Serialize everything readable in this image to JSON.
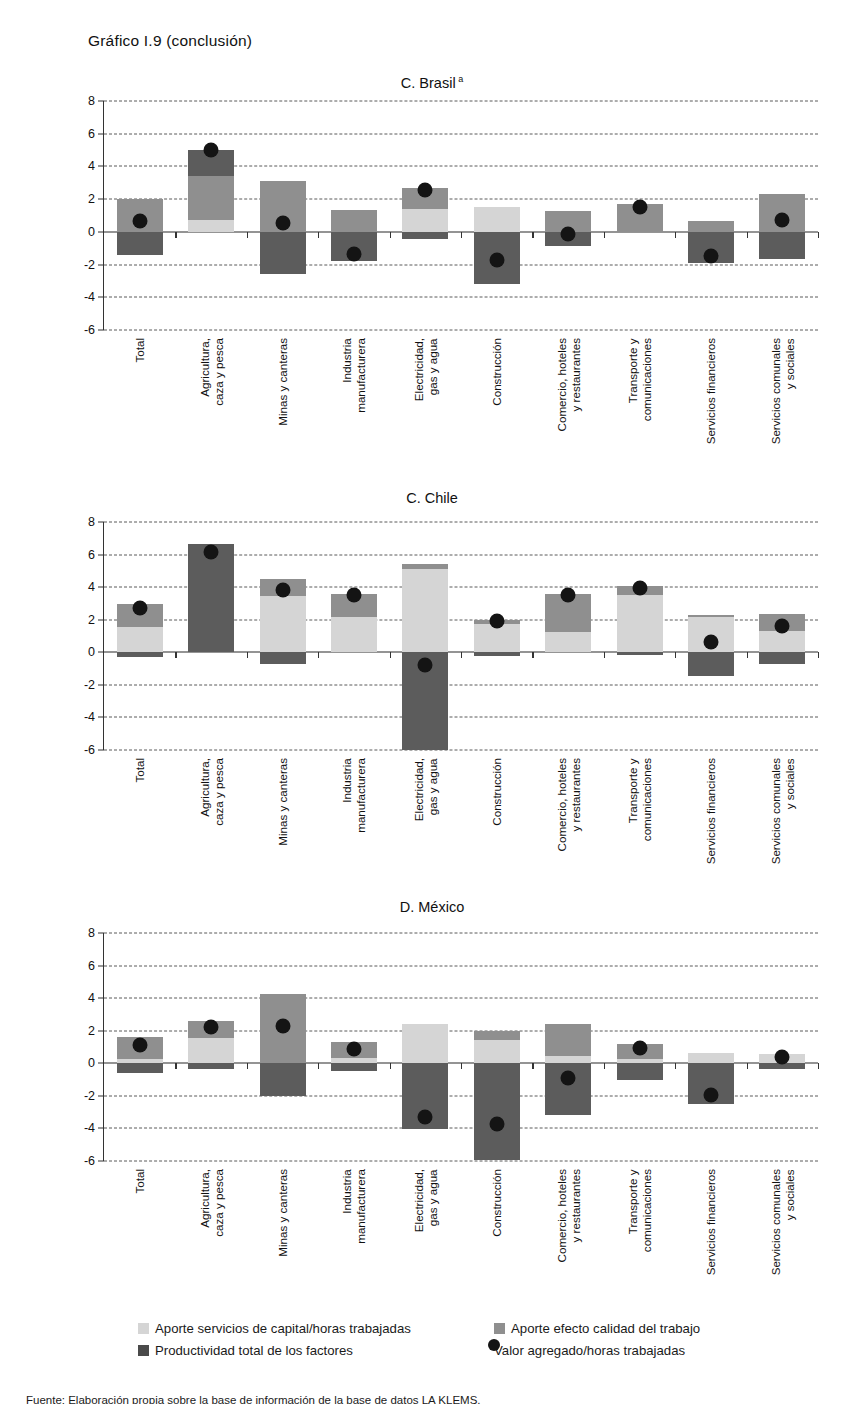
{
  "figure": {
    "title": "Gráfico I.9 (conclusión)",
    "footnote": "Fuente: Elaboración propia sobre la base de información de la base de datos LA KLEMS."
  },
  "axis": {
    "ticks": [
      8,
      6,
      4,
      2,
      0,
      -2,
      -4,
      -6
    ],
    "ymin": -6,
    "ymax": 8
  },
  "categories": [
    "Total",
    "Agricultura,\ncaza y pesca",
    "Minas y canteras",
    "Industria\nmanufacturera",
    "Electricidad,\ngas y agua",
    "Construcción",
    "Comercio, hoteles\ny restaurantes",
    "Transporte y\ncomunicaciones",
    "Servicios financieros",
    "Servicios comunales\ny sociales"
  ],
  "legend": {
    "items": [
      {
        "key": "capital",
        "label": "Aporte servicios de capital/horas trabajadas",
        "color": "#d5d5d5",
        "shape": "square"
      },
      {
        "key": "quality",
        "label": "Aporte efecto calidad del trabajo",
        "color": "#8f8f8f",
        "shape": "square"
      },
      {
        "key": "tfp",
        "label": "Productividad total de los factores",
        "color": "#4a4a4a",
        "shape": "square"
      },
      {
        "key": "value_added",
        "label": "Valor agregado/horas trabajadas",
        "color": "#141414",
        "shape": "circle"
      }
    ]
  },
  "chart_data": [
    {
      "type": "bar",
      "panel_id": "brasil",
      "title": "C. Brasil",
      "title_superscript": "a",
      "stacked": true,
      "grid": true,
      "ylim": [
        -6,
        8
      ],
      "ylabel": "",
      "xlabel": "",
      "categories": [
        "Total",
        "Agricultura, caza y pesca",
        "Minas y canteras",
        "Industria manufacturera",
        "Electricidad, gas y agua",
        "Construcción",
        "Comercio, hoteles y restaurantes",
        "Transporte y comunicaciones",
        "Servicios financieros",
        "Servicios comunales y sociales"
      ],
      "series": [
        {
          "name": "Aporte servicios de capital/horas trabajadas",
          "key": "capital",
          "values": [
            0.0,
            0.7,
            0.0,
            0.0,
            1.4,
            1.5,
            0.0,
            0.0,
            0.0,
            0.0
          ]
        },
        {
          "name": "Aporte efecto calidad del trabajo",
          "key": "quality",
          "values": [
            2.0,
            2.7,
            3.1,
            1.35,
            1.3,
            0.0,
            1.25,
            1.7,
            0.65,
            2.3
          ]
        },
        {
          "name": "Productividad total de los factores",
          "key": "tfp",
          "values": [
            -1.4,
            1.6,
            -2.55,
            -1.8,
            -0.45,
            -3.2,
            -0.85,
            0.0,
            -1.9,
            -1.65
          ]
        }
      ],
      "markers": {
        "name": "Valor agregado/horas trabajadas",
        "key": "value_added",
        "values": [
          0.65,
          5.0,
          0.55,
          -1.35,
          2.55,
          -1.7,
          -0.15,
          1.5,
          -1.45,
          0.7
        ]
      }
    },
    {
      "type": "bar",
      "panel_id": "chile",
      "title": "C. Chile",
      "title_superscript": "",
      "stacked": true,
      "grid": true,
      "ylim": [
        -6,
        8
      ],
      "ylabel": "",
      "xlabel": "",
      "categories": [
        "Total",
        "Agricultura, caza y pesca",
        "Minas y canteras",
        "Industria manufacturera",
        "Electricidad, gas y agua",
        "Construcción",
        "Comercio, hoteles y restaurantes",
        "Transporte y comunicaciones",
        "Servicios financieros",
        "Servicios comunales y sociales"
      ],
      "series": [
        {
          "name": "Aporte servicios de capital/horas trabajadas",
          "key": "capital",
          "values": [
            1.55,
            0.0,
            3.45,
            2.15,
            5.1,
            1.75,
            1.25,
            3.5,
            2.15,
            1.3
          ]
        },
        {
          "name": "Aporte efecto calidad del trabajo",
          "key": "quality",
          "values": [
            1.4,
            0.0,
            1.05,
            1.4,
            0.3,
            0.25,
            2.3,
            0.6,
            0.15,
            1.05
          ]
        },
        {
          "name": "Productividad total de los factores",
          "key": "tfp",
          "values": [
            -0.3,
            6.65,
            -0.75,
            0.0,
            -6.0,
            -0.2,
            0.0,
            -0.15,
            -1.45,
            -0.75
          ]
        }
      ],
      "markers": {
        "name": "Valor agregado/horas trabajadas",
        "key": "value_added",
        "values": [
          2.75,
          6.15,
          3.8,
          3.5,
          -0.75,
          1.9,
          3.5,
          3.95,
          0.65,
          1.6
        ]
      }
    },
    {
      "type": "bar",
      "panel_id": "mexico",
      "title": "D. México",
      "title_superscript": "",
      "stacked": true,
      "grid": true,
      "ylim": [
        -6,
        8
      ],
      "ylabel": "",
      "xlabel": "",
      "categories": [
        "Total",
        "Agricultura, caza y pesca",
        "Minas y canteras",
        "Industria manufacturera",
        "Electricidad, gas y agua",
        "Construcción",
        "Comercio, hoteles y restaurantes",
        "Transporte y comunicaciones",
        "Servicios financieros",
        "Servicios comunales y sociales"
      ],
      "series": [
        {
          "name": "Aporte servicios de capital/horas trabajadas",
          "key": "capital",
          "values": [
            0.25,
            1.55,
            0.0,
            0.35,
            2.4,
            1.4,
            0.45,
            0.25,
            0.65,
            0.55
          ]
        },
        {
          "name": "Aporte efecto calidad del trabajo",
          "key": "quality",
          "values": [
            1.35,
            1.05,
            4.25,
            0.95,
            0.0,
            0.6,
            1.95,
            0.95,
            0.0,
            0.0
          ]
        },
        {
          "name": "Productividad total de los factores",
          "key": "tfp",
          "values": [
            -0.6,
            -0.35,
            -2.0,
            -0.45,
            -4.05,
            -5.95,
            -3.15,
            -1.0,
            -2.5,
            -0.35
          ]
        }
      ],
      "markers": {
        "name": "Valor agregado/horas trabajadas",
        "key": "value_added",
        "values": [
          1.15,
          2.25,
          2.3,
          0.9,
          -3.3,
          -3.7,
          -0.9,
          0.95,
          -1.95,
          0.4
        ]
      }
    }
  ]
}
